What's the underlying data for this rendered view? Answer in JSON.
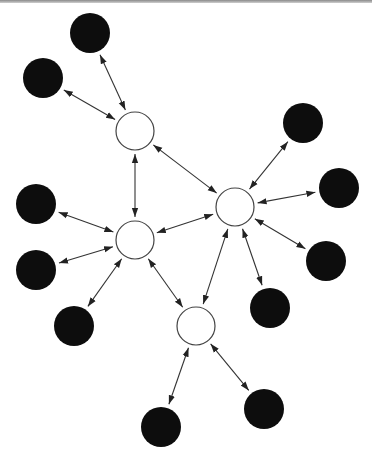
{
  "diagram": {
    "type": "network-graph",
    "colors": {
      "background": "#ffffff",
      "hub_fill": "#ffffff",
      "hub_stroke": "#444444",
      "leaf_fill": "#0d0d0d",
      "edge": "#333333",
      "top_rule": "#8a8a8a"
    },
    "node_radius": {
      "hub": 19,
      "leaf": 20
    },
    "nodes": [
      {
        "id": "hubA",
        "kind": "hub",
        "x": 135,
        "y": 131
      },
      {
        "id": "hubB",
        "kind": "hub",
        "x": 235,
        "y": 207
      },
      {
        "id": "hubC",
        "kind": "hub",
        "x": 135,
        "y": 240
      },
      {
        "id": "hubD",
        "kind": "hub",
        "x": 196,
        "y": 326
      },
      {
        "id": "leaf1",
        "kind": "leaf",
        "x": 90,
        "y": 33
      },
      {
        "id": "leaf2",
        "kind": "leaf",
        "x": 43,
        "y": 78
      },
      {
        "id": "leaf3",
        "kind": "leaf",
        "x": 303,
        "y": 123
      },
      {
        "id": "leaf4",
        "kind": "leaf",
        "x": 339,
        "y": 188
      },
      {
        "id": "leaf5",
        "kind": "leaf",
        "x": 326,
        "y": 261
      },
      {
        "id": "leaf6",
        "kind": "leaf",
        "x": 270,
        "y": 308
      },
      {
        "id": "leaf7",
        "kind": "leaf",
        "x": 36,
        "y": 204
      },
      {
        "id": "leaf8",
        "kind": "leaf",
        "x": 36,
        "y": 270
      },
      {
        "id": "leaf9",
        "kind": "leaf",
        "x": 74,
        "y": 326
      },
      {
        "id": "leaf10",
        "kind": "leaf",
        "x": 161,
        "y": 427
      },
      {
        "id": "leaf11",
        "kind": "leaf",
        "x": 264,
        "y": 409
      }
    ],
    "edges": [
      {
        "from": "hubA",
        "to": "leaf1",
        "bidirectional": true
      },
      {
        "from": "hubA",
        "to": "leaf2",
        "bidirectional": true
      },
      {
        "from": "hubA",
        "to": "hubB",
        "bidirectional": true
      },
      {
        "from": "hubA",
        "to": "hubC",
        "bidirectional": true
      },
      {
        "from": "hubB",
        "to": "leaf3",
        "bidirectional": true
      },
      {
        "from": "hubB",
        "to": "leaf4",
        "bidirectional": true
      },
      {
        "from": "hubB",
        "to": "leaf5",
        "bidirectional": true
      },
      {
        "from": "hubB",
        "to": "leaf6",
        "bidirectional": true
      },
      {
        "from": "hubB",
        "to": "hubC",
        "bidirectional": true
      },
      {
        "from": "hubB",
        "to": "hubD",
        "bidirectional": true
      },
      {
        "from": "hubC",
        "to": "leaf7",
        "bidirectional": true
      },
      {
        "from": "hubC",
        "to": "leaf8",
        "bidirectional": true
      },
      {
        "from": "hubC",
        "to": "leaf9",
        "bidirectional": true
      },
      {
        "from": "hubC",
        "to": "hubD",
        "bidirectional": true
      },
      {
        "from": "hubD",
        "to": "leaf10",
        "bidirectional": true
      },
      {
        "from": "hubD",
        "to": "leaf11",
        "bidirectional": true
      }
    ]
  }
}
